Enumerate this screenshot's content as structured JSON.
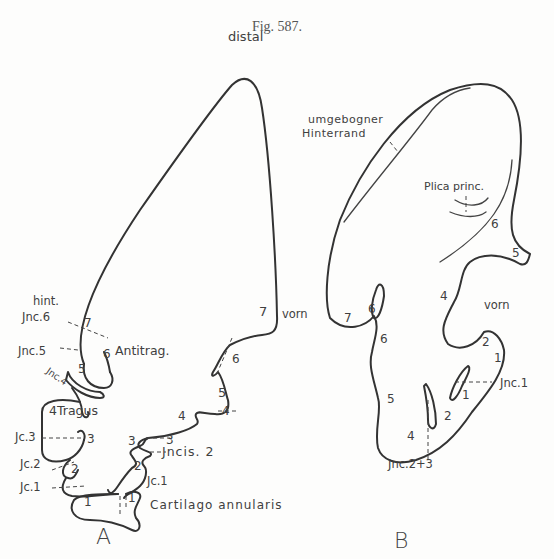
{
  "figure": {
    "title": "Fig. 587.",
    "panels": {
      "A": {
        "label": "A",
        "labels": {
          "distal": "distal",
          "hint": "hint.",
          "vorn": "vorn",
          "jnc6": "Jnc.6",
          "jnc5": "Jnc.5",
          "jnc4": "Jnc.4",
          "antitrag": "Antitrag.",
          "tragus": "4Tragus",
          "jc3": "Jc.3",
          "jc2": "Jc.2",
          "jc1_left": "Jc.1",
          "jc1_right": "Jc.1",
          "jncis2": "Jncis. 2",
          "cartilago": "Cartilago annularis"
        },
        "numbers": {
          "n7_left": "7",
          "n6_left": "6",
          "n5_left": "5",
          "n3_left": "3",
          "n2_left": "2",
          "n1_left": "1",
          "n7_right": "7",
          "n6_right": "6",
          "n5_right": "5",
          "n4_right_in": "4",
          "n4_right_out": "4",
          "n3_right_in": "3",
          "n3_right_out": "3",
          "n2_right": "2",
          "n1_right": "1"
        }
      },
      "B": {
        "label": "B",
        "labels": {
          "umgebogner": "umgebogner",
          "hinterrand": "Hinterrand",
          "plica": "Plica princ.",
          "vorn": "vorn",
          "jnc1": "Jnc.1",
          "jnc23": "Jnc.2+3"
        },
        "numbers": {
          "n6_top": "6",
          "n5_top": "5",
          "n4_mid": "4",
          "n7_left": "7",
          "n6_left_in": "6",
          "n6_left_out": "6",
          "n5_left": "5",
          "n4_bottom": "4",
          "n2_right": "2",
          "n1_right": "1",
          "n1_inner": "1",
          "n2_inner": "2"
        }
      }
    }
  }
}
